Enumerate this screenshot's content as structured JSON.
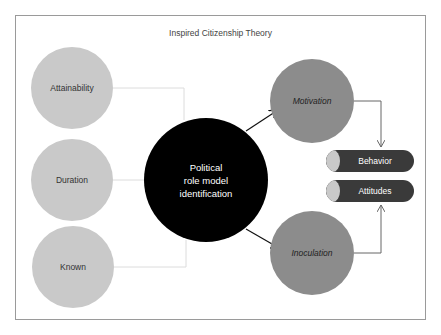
{
  "title": "Inspired Citizenship Theory",
  "antecedents": [
    {
      "label": "Attainability"
    },
    {
      "label": "Duration"
    },
    {
      "label": "Known"
    }
  ],
  "central": {
    "label_lines": [
      "Political",
      "role model",
      "identification"
    ]
  },
  "mediators": [
    {
      "label": "Motivation"
    },
    {
      "label": "Inoculation"
    }
  ],
  "outcomes": [
    {
      "label": "Behavior"
    },
    {
      "label": "Attitudes"
    }
  ],
  "colors": {
    "antecedent_fill": "#c9c9c9",
    "central_fill": "#000000",
    "mediator_fill": "#8c8c8c",
    "outcome_fill": "#3a3a3a",
    "connector": "#d8d8d8"
  }
}
